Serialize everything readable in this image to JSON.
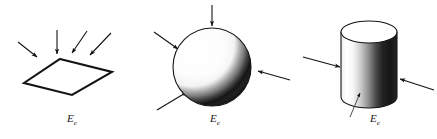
{
  "figure": {
    "background_color": "#ffffff",
    "ink_color": "#141414",
    "width": 437,
    "height": 139,
    "panels": [
      {
        "id": "plane",
        "shape_name": "flat-surface-parallelogram",
        "label": "E",
        "label_subscript": "e",
        "label_x": 72,
        "label_y": 122,
        "ray_count": 4,
        "ray_note": "four incident rays arriving from upper-left and upper-right onto the flat plate"
      },
      {
        "id": "sphere",
        "shape_name": "sphere",
        "label": "E",
        "label_subscript": "e",
        "label_x": 215,
        "label_y": 122,
        "ray_count": 4,
        "ray_note": "four incident rays arriving from top, upper-left, right and lower-left onto the sphere"
      },
      {
        "id": "cylinder",
        "shape_name": "cylinder",
        "label": "E",
        "label_subscript": "e",
        "label_x": 375,
        "label_y": 122,
        "ray_count": 3,
        "ray_note": "two incident rays from left and right plus a leader line pointing to the lit surface"
      }
    ],
    "shading": {
      "sphere_light_direction": "upper-left",
      "sphere_dark_region": "lower-right crescent",
      "cylinder_light_direction": "left",
      "cylinder_dark_region": "right side of the barrel",
      "cylinder_top_face": "white ellipse"
    }
  }
}
